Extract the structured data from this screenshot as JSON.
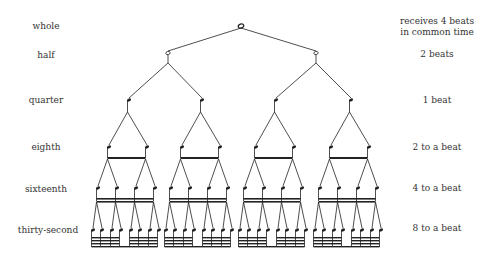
{
  "rows": [
    {
      "name": "whole",
      "beats": "receives 4 beats",
      "beats_line2": "in common time"
    },
    {
      "name": "half",
      "beats": "2 beats"
    },
    {
      "name": "quarter",
      "beats": "1 beat"
    },
    {
      "name": "eighth",
      "beats": "2 to a beat"
    },
    {
      "name": "sixteenth",
      "beats": "4 to a beat"
    },
    {
      "name": "thirty-second",
      "beats": "8 to a beat"
    }
  ],
  "tree": {
    "levels": [
      "whole",
      "half",
      "quarter",
      "eighth",
      "sixteenth",
      "thirty-second"
    ],
    "node_counts": [
      1,
      2,
      4,
      8,
      16,
      32
    ],
    "ink_color": "#222222"
  }
}
